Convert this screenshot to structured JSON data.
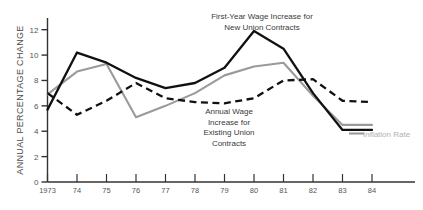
{
  "chart_data": {
    "type": "line",
    "title": "",
    "xlabel": "",
    "ylabel": "ANNUAL PERCENTAGE CHANGE",
    "xlim": [
      1973,
      1984
    ],
    "ylim": [
      0,
      13
    ],
    "grid": false,
    "legend_position": "inline-annotations",
    "x": [
      1973,
      1974,
      1975,
      1976,
      1977,
      1978,
      1979,
      1980,
      1981,
      1982,
      1983,
      1984
    ],
    "xtick_labels": [
      "1973",
      "74",
      "75",
      "76",
      "77",
      "78",
      "79",
      "80",
      "81",
      "82",
      "83",
      "84"
    ],
    "ytick_labels": [
      "0",
      "2",
      "4",
      "6",
      "8",
      "10",
      "12"
    ],
    "ytick_values": [
      0,
      2,
      4,
      6,
      8,
      10,
      12
    ],
    "series": [
      {
        "name": "First-Year Wage Increase for New Union Contracts",
        "style": "solid",
        "color": "#111111",
        "values": [
          5.7,
          10.2,
          9.4,
          8.2,
          7.4,
          7.8,
          9.0,
          11.9,
          10.5,
          7.0,
          4.1,
          4.1
        ]
      },
      {
        "name": "Annual Wage Increase for Existing Union Contracts",
        "style": "dashed",
        "color": "#111111",
        "values": [
          7.0,
          5.3,
          6.4,
          7.8,
          6.6,
          6.3,
          6.2,
          6.6,
          8.0,
          8.1,
          6.4,
          6.3
        ]
      },
      {
        "name": "Inflation Rate",
        "style": "solid",
        "color": "#9a9a9a",
        "values": [
          6.9,
          8.7,
          9.3,
          5.1,
          6.0,
          7.0,
          8.4,
          9.1,
          9.4,
          6.8,
          4.5,
          4.5
        ]
      }
    ],
    "annotations": [
      {
        "id": "first_year",
        "text": "First-Year  Wage Increase for\nNew  Union Contracts"
      },
      {
        "id": "annual_wage",
        "text": "Annual Wage\nIncrease for\nExisting Union\nContracts"
      },
      {
        "id": "inflation_rate",
        "text": "Inflation Rate"
      }
    ]
  },
  "axis": {
    "y_title": "ANNUAL PERCENTAGE CHANGE"
  }
}
